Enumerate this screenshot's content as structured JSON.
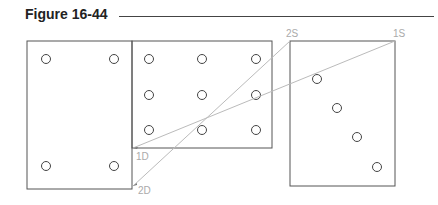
{
  "figure": {
    "title": "Figure 16-44"
  },
  "labels": {
    "source_1": "1S",
    "source_2": "2S",
    "dest_1": "1D",
    "dest_2": "2D"
  },
  "colors": {
    "outline": "#555555",
    "construction_line": "#bbbbbb",
    "label": "#aaaaaa"
  }
}
